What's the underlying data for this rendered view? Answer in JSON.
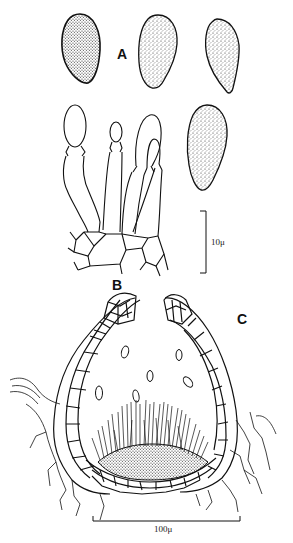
{
  "figure": {
    "panels": {
      "A": {
        "label": "A",
        "description": "Ascospores (four, punctate/stippled, obovoid)"
      },
      "B": {
        "label": "B",
        "description": "Asci with basal hyphal cells"
      },
      "C": {
        "label": "C",
        "description": "Section through perithecium with ostiole, spores and basal paraphyses"
      }
    },
    "scale_bars": [
      {
        "id": "small",
        "label": "10μ",
        "orientation": "vertical",
        "applies_to": [
          "A",
          "B"
        ]
      },
      {
        "id": "large",
        "label": "100μ",
        "orientation": "horizontal",
        "applies_to": [
          "C"
        ]
      }
    ],
    "colors": {
      "ink": "#111111",
      "background": "#ffffff"
    }
  }
}
